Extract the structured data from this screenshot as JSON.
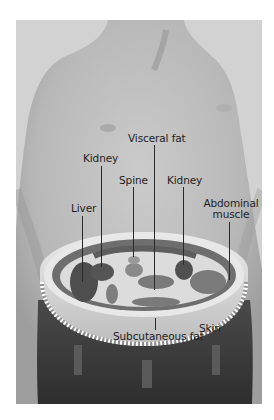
{
  "figure": {
    "type": "anatomical-cross-section",
    "labels": [
      {
        "id": "visceral-fat",
        "text": "Visceral fat"
      },
      {
        "id": "kidney-left",
        "text": "Kidney"
      },
      {
        "id": "spine",
        "text": "Spine"
      },
      {
        "id": "kidney-right",
        "text": "Kidney"
      },
      {
        "id": "liver",
        "text": "Liver"
      },
      {
        "id": "abdominal-muscle",
        "text": "Abdominal muscle",
        "line1": "Abdominal",
        "line2": "muscle"
      },
      {
        "id": "subcutaneous-fat",
        "text": "Subcutaneous fat"
      },
      {
        "id": "skin",
        "text": "Skin"
      }
    ],
    "colors": {
      "background": "#d2d2d2",
      "skin_tone": "#bdbdbd",
      "organ_dark": "#555555",
      "muscle": "#6b6b6b",
      "fat": "#e6e6e6",
      "pants": "#3a3a3a"
    }
  }
}
